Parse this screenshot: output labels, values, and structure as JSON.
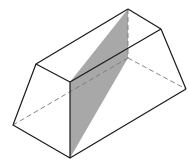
{
  "diagram": {
    "type": "geometric-solid",
    "colors": {
      "stroke": "#1a1a1a",
      "hidden": "#777777",
      "shade": "#a8a8a8",
      "background": "#ffffff"
    },
    "vertices": {
      "front_top_left": [
        36,
        64
      ],
      "front_top_right": [
        70,
        82
      ],
      "front_bottom_right": [
        70,
        158
      ],
      "front_bottom_left": [
        13,
        125
      ],
      "back_top_left": [
        128,
        9
      ],
      "back_top_right": [
        161,
        29
      ],
      "back_bottom_right": [
        186,
        89
      ],
      "back_bottom_left": [
        128,
        58
      ]
    },
    "shaded_plane": [
      "front_top_right",
      "back_top_left",
      "back_bottom_left",
      "front_bottom_right"
    ]
  }
}
